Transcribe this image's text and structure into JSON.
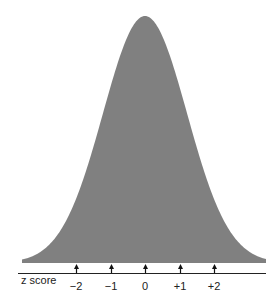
{
  "chart_data": {
    "type": "area",
    "title": "",
    "xlabel": "z score",
    "ylabel": "",
    "tick_labels": [
      "−2",
      "−1",
      "0",
      "+1",
      "+2"
    ],
    "tick_values": [
      -2,
      -1,
      0,
      1,
      2
    ],
    "curve": {
      "mean": 0,
      "sd": 1,
      "fill_color": "#808080"
    },
    "grid": false,
    "legend": null
  },
  "layout": {
    "center_x": 145,
    "baseline_y": 263,
    "peak_y": 16,
    "curve_sigma_px": 42,
    "curve_x_range": [
      22,
      266
    ],
    "axis_y": 273,
    "axis_x_range": [
      18,
      266
    ],
    "tick_positions_x": [
      76,
      111,
      145,
      180,
      214
    ]
  }
}
